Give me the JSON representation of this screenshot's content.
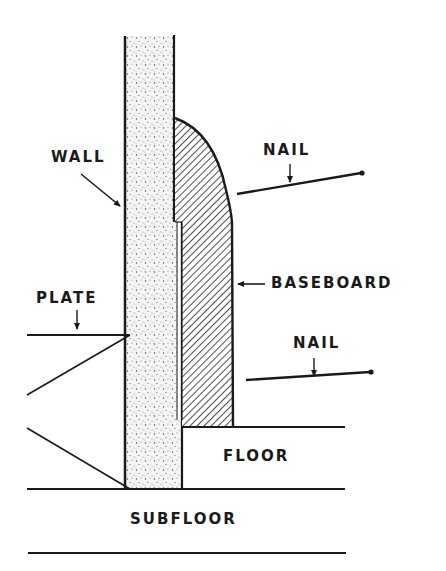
{
  "diagram": {
    "type": "cross-section",
    "labels": {
      "wall": "WALL",
      "nail_upper": "NAIL",
      "baseboard": "BASEBOARD",
      "plate": "PLATE",
      "nail_lower": "NAIL",
      "floor": "FLOOR",
      "subfloor": "SUBFLOOR"
    },
    "colors": {
      "line": "#1a1a1a",
      "background": "#ffffff",
      "wall_fill": "#f4f4f4"
    }
  }
}
